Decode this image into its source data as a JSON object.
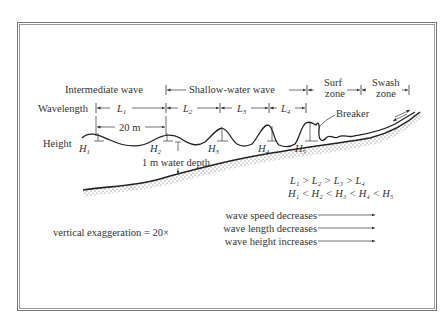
{
  "diagram": {
    "zones": {
      "intermediate": "Intermediate wave",
      "shallow": "Shallow-water wave",
      "surf_line1": "Surf",
      "surf_line2": "zone",
      "swash_line1": "Swash",
      "swash_line2": "zone"
    },
    "wavelength": {
      "label": "Wavelength",
      "segments": [
        "L",
        "L",
        "L",
        "L"
      ],
      "subscripts": [
        "1",
        "2",
        "3",
        "4"
      ]
    },
    "spacing_label": "20 m",
    "height": {
      "label": "Height",
      "markers": [
        "H",
        "H",
        "H",
        "H",
        "H"
      ],
      "subscripts": [
        "1",
        "2",
        "3",
        "4",
        "5"
      ]
    },
    "breaker_label": "Breaker",
    "depth_label": "1 m water depth",
    "relations": {
      "wavelength": "L₁ > L₂ > L₃ > L₄",
      "height": "H₁ < H₂ < H₃ < H₄ < H₅"
    },
    "exaggeration": "vertical exaggeration = 20×",
    "trends": [
      "wave speed decreases",
      "wave length decreases",
      "wave height increases"
    ]
  }
}
